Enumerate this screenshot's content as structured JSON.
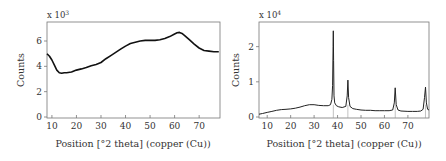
{
  "chart_data": [
    {
      "type": "line",
      "title": "",
      "xlabel": "Position [°2 theta] (copper (Cu))",
      "ylabel": "Counts",
      "y_multiplier": "x 10^3",
      "y_multiplier_base": "x 10",
      "y_multiplier_exp": "3",
      "xlim": [
        8,
        78.5
      ],
      "ylim": [
        0,
        7.5
      ],
      "x_ticks": [
        10,
        20,
        30,
        40,
        50,
        60,
        70
      ],
      "y_ticks": [
        0,
        2,
        4,
        6
      ],
      "grid": false,
      "legend": null,
      "series": [
        {
          "name": "pattern",
          "x": [
            8,
            9,
            10,
            11,
            12,
            13,
            14,
            15,
            16,
            18,
            20,
            22,
            24,
            26,
            28,
            30,
            32,
            34,
            36,
            38,
            40,
            42,
            44,
            46,
            48,
            50,
            52,
            54,
            56,
            58,
            60,
            61,
            62,
            63,
            64,
            66,
            68,
            70,
            72,
            74,
            76,
            78
          ],
          "y": [
            5.0,
            4.8,
            4.5,
            4.1,
            3.7,
            3.5,
            3.45,
            3.5,
            3.5,
            3.55,
            3.7,
            3.8,
            3.9,
            4.05,
            4.15,
            4.3,
            4.6,
            4.85,
            5.1,
            5.35,
            5.6,
            5.8,
            5.9,
            6.0,
            6.05,
            6.05,
            6.05,
            6.1,
            6.2,
            6.35,
            6.55,
            6.65,
            6.68,
            6.6,
            6.45,
            6.1,
            5.75,
            5.45,
            5.25,
            5.2,
            5.15,
            5.15
          ]
        }
      ]
    },
    {
      "type": "line",
      "title": "",
      "xlabel": "Position [°2 theta] (copper (Cu))",
      "ylabel": "Counts",
      "y_multiplier": "x 10^4",
      "y_multiplier_base": "x 10",
      "y_multiplier_exp": "4",
      "xlim": [
        6.5,
        79
      ],
      "ylim": [
        0,
        2.7
      ],
      "x_ticks": [
        10,
        20,
        30,
        40,
        50,
        60,
        70
      ],
      "y_ticks": [
        0,
        1,
        2
      ],
      "grid": false,
      "legend": null,
      "reference_lines_x": [
        38.2,
        44.4,
        64.6,
        77.5
      ],
      "series": [
        {
          "name": "pattern",
          "x": [
            6.5,
            8,
            10,
            12,
            14,
            16,
            18,
            20,
            22,
            24,
            26,
            28,
            30,
            32,
            34,
            36,
            37,
            37.6,
            37.9,
            38.1,
            38.2,
            38.3,
            38.5,
            38.8,
            39.5,
            40.5,
            42,
            43.5,
            44.1,
            44.4,
            44.7,
            45.3,
            46.5,
            48,
            50,
            52,
            54,
            56,
            58,
            60,
            62,
            63.5,
            64.2,
            64.6,
            65.0,
            65.8,
            67,
            70,
            72,
            74,
            75.5,
            76.5,
            77.1,
            77.5,
            77.9,
            78.4,
            79
          ],
          "y": [
            0.08,
            0.1,
            0.13,
            0.16,
            0.19,
            0.21,
            0.22,
            0.23,
            0.25,
            0.28,
            0.32,
            0.35,
            0.35,
            0.33,
            0.32,
            0.32,
            0.35,
            0.5,
            0.9,
            2.0,
            2.45,
            1.6,
            0.6,
            0.4,
            0.32,
            0.29,
            0.27,
            0.3,
            0.6,
            1.05,
            0.55,
            0.3,
            0.24,
            0.22,
            0.2,
            0.19,
            0.19,
            0.18,
            0.18,
            0.18,
            0.18,
            0.2,
            0.4,
            0.83,
            0.35,
            0.2,
            0.17,
            0.16,
            0.16,
            0.16,
            0.17,
            0.22,
            0.55,
            0.85,
            0.4,
            0.22,
            0.2
          ]
        }
      ]
    }
  ],
  "labels": {
    "left_ylabel": "Counts",
    "right_ylabel": "Counts",
    "left_xlabel": "Position [°2 theta] (copper (Cu))",
    "right_xlabel": "Position [°2 theta] (copper (Cu))",
    "left_mult_base": "x 10",
    "left_mult_exp": "3",
    "right_mult_base": "x 10",
    "right_mult_exp": "4"
  },
  "colors": {
    "line": "#111111",
    "frame": "#777777",
    "text": "#333333",
    "ref_line": "#999999"
  }
}
